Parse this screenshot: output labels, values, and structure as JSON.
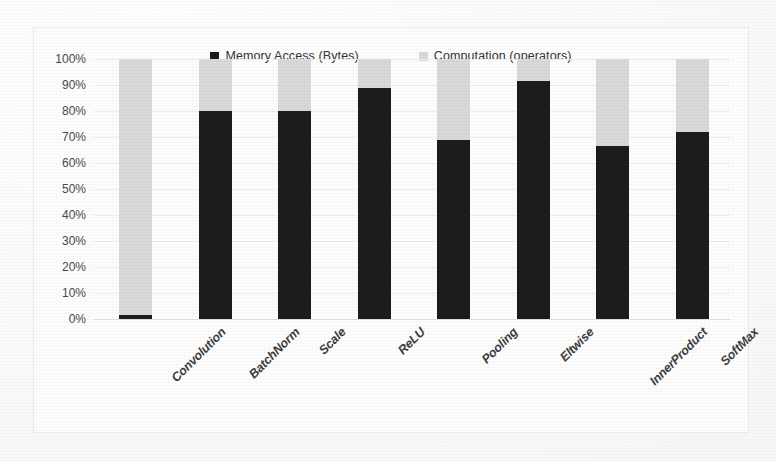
{
  "chart_data": {
    "type": "bar",
    "title": "",
    "subtitle": "",
    "xlabel": "",
    "ylabel": "",
    "stacked": true,
    "stack_mode": "percent",
    "grid": true,
    "legend_position": "top-center",
    "ylim": [
      0,
      100
    ],
    "ytick_labels": [
      "100%",
      "90%",
      "80%",
      "70%",
      "60%",
      "50%",
      "40%",
      "30%",
      "20%",
      "10%",
      "0%"
    ],
    "ytick_values": [
      100,
      90,
      80,
      70,
      60,
      50,
      40,
      30,
      20,
      10,
      0
    ],
    "categories": [
      "Convolution",
      "BatchNorm",
      "Scale",
      "ReLU",
      "Pooling",
      "Eltwise",
      "InnerProduct",
      "SoftMax"
    ],
    "series": [
      {
        "name": "Memory Access (Bytes)",
        "color": "#1c1c1c",
        "values": [
          1.5,
          80,
          80,
          88.8,
          69,
          91.5,
          66.5,
          72
        ]
      },
      {
        "name": "Computation (operators)",
        "color": "#d9d9d9",
        "values": [
          98.5,
          20,
          20,
          11.2,
          31,
          8.5,
          33.5,
          28
        ]
      }
    ]
  },
  "legend": {
    "items": [
      {
        "label": "Memory Access (Bytes)",
        "swatch_class": "sw-memory"
      },
      {
        "label": "Computation (operators)",
        "swatch_class": "sw-compute"
      }
    ]
  },
  "colors": {
    "memory_access": "#1c1c1c",
    "computation": "#d9d9d9",
    "gridline": "#ededed",
    "frame_border": "#ececec",
    "background": "#fdfdfd",
    "axis_text": "#4a4a4a",
    "label_text": "#3c3c3c"
  }
}
